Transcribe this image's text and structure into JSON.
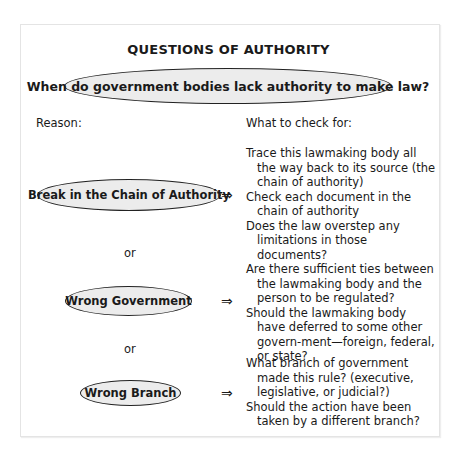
{
  "title": "QUESTIONS OF AUTHORITY",
  "question": "When do government bodies lack authority to make law?",
  "labels": {
    "reason": "Reason:",
    "check": "What to check for:"
  },
  "connector": "or",
  "arrow_glyph": "⇒",
  "colors": {
    "oval_fill": "#ececec",
    "oval_border": "#222222",
    "text": "#1a1a1a"
  },
  "reasons": [
    {
      "label": "Break in the Chain of Authority",
      "checks": [
        "Trace this lawmaking body all the way back to its source (the chain of authority)",
        "Check each document in the chain of authority",
        "Does the law overstep any limitations in those documents?"
      ]
    },
    {
      "label": "Wrong Government",
      "checks": [
        "Are there sufficient ties between the lawmaking body and the person to be regulated?",
        "Should the lawmaking body have deferred to some other govern-ment—foreign, federal, or state?"
      ]
    },
    {
      "label": "Wrong Branch",
      "checks": [
        "What branch of government made this rule? (executive, legislative, or judicial?)",
        "Should the action have been taken by a different branch?"
      ]
    }
  ]
}
